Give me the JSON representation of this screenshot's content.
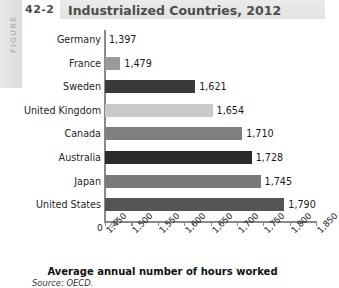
{
  "figure": {
    "band_word": "FIGURE",
    "number": "42-2",
    "title": "Industrialized Countries, 2012",
    "source": "Source: OECD."
  },
  "chart_data": {
    "type": "bar",
    "orientation": "horizontal",
    "title": "Industrialized Countries, 2012",
    "xlabel": "Average annual number of hours worked",
    "ylabel": "",
    "categories": [
      "Germany",
      "France",
      "Sweden",
      "United Kingdom",
      "Canada",
      "Australia",
      "Japan",
      "United States"
    ],
    "values": [
      1397,
      1479,
      1621,
      1654,
      1710,
      1728,
      1745,
      1790
    ],
    "value_labels": [
      "1,397",
      "1,479",
      "1,621",
      "1,654",
      "1,710",
      "1,728",
      "1,745",
      "1,790"
    ],
    "bar_colors": [
      "#8c8c8c",
      "#9a9a9a",
      "#3a3a3a",
      "#c9c9c9",
      "#808080",
      "#2b2b2b",
      "#7a7a7a",
      "#555555"
    ],
    "xlim": [
      1450,
      1850
    ],
    "zero_tick": "0",
    "axis_break": "//",
    "xticks": [
      1450,
      1500,
      1550,
      1600,
      1650,
      1700,
      1750,
      1800,
      1850
    ],
    "xtick_labels": [
      "1,450",
      "1,500",
      "1,550",
      "1,600",
      "1,650",
      "1,700",
      "1,750",
      "1,800",
      "1,850"
    ],
    "grid": false,
    "legend": false,
    "source": "Source: OECD."
  }
}
